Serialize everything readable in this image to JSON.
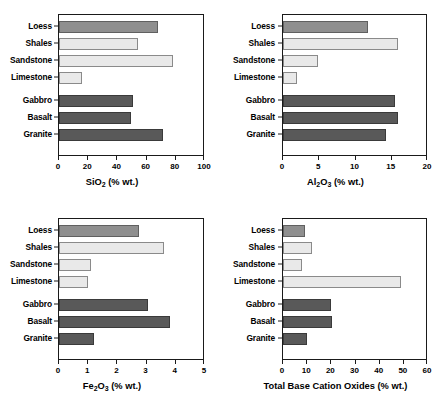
{
  "figure": {
    "categories": [
      "Loess",
      "Shales",
      "Sandstone",
      "Limestone",
      "Gabbro",
      "Basalt",
      "Granite"
    ],
    "group_colors": {
      "loess": "#8F8F8F",
      "sedimentary": "#E9E9E9",
      "igneous": "#595959"
    }
  },
  "chart_data": [
    {
      "type": "bar",
      "orientation": "horizontal",
      "panel": "top-left",
      "title": "",
      "xlabel": "SiO2 (% wt.)",
      "xlabel_parts": {
        "pre": "SiO",
        "sub": "2",
        "post": " (% wt.)"
      },
      "ylabel": "",
      "categories": [
        "Loess",
        "Shales",
        "Sandstone",
        "Limestone",
        "Gabbro",
        "Basalt",
        "Granite"
      ],
      "values": [
        68.0,
        54.0,
        78.0,
        16.0,
        50.5,
        49.5,
        71.0
      ],
      "xlim": [
        0,
        100
      ],
      "xticks": [
        0,
        20,
        40,
        60,
        80,
        100
      ],
      "xticklabels": [
        "0",
        "20",
        "40",
        "60",
        "80",
        "100"
      ],
      "grid": false,
      "legend": "none"
    },
    {
      "type": "bar",
      "orientation": "horizontal",
      "panel": "top-right",
      "title": "",
      "xlabel": "Al2O3 (% wt.)",
      "xlabel_parts": {
        "pre": "Al",
        "sub": "2",
        "mid": "O",
        "sub2": "3",
        "post": " (% wt.)"
      },
      "ylabel": "",
      "categories": [
        "Loess",
        "Shales",
        "Sandstone",
        "Limestone",
        "Gabbro",
        "Basalt",
        "Granite"
      ],
      "values": [
        11.7,
        15.8,
        4.8,
        1.9,
        15.5,
        15.8,
        14.2
      ],
      "xlim": [
        0,
        20
      ],
      "xticks": [
        0,
        5,
        10,
        15,
        20
      ],
      "xticklabels": [
        "0",
        "5",
        "10",
        "15",
        "20"
      ],
      "grid": false,
      "legend": "none"
    },
    {
      "type": "bar",
      "orientation": "horizontal",
      "panel": "bottom-left",
      "title": "",
      "xlabel": "Fe2O3 (% wt.)",
      "xlabel_parts": {
        "pre": "Fe",
        "sub": "2",
        "mid": "O",
        "sub2": "3",
        "post": " (% wt.)"
      },
      "ylabel": "",
      "categories": [
        "Loess",
        "Shales",
        "Sandstone",
        "Limestone",
        "Gabbro",
        "Basalt",
        "Granite"
      ],
      "values": [
        2.75,
        3.6,
        1.1,
        1.0,
        3.05,
        3.8,
        1.2
      ],
      "xlim": [
        0,
        5
      ],
      "xticks": [
        0,
        1,
        2,
        3,
        4,
        5
      ],
      "xticklabels": [
        "0",
        "1",
        "2",
        "3",
        "4",
        "5"
      ],
      "grid": false,
      "legend": "none"
    },
    {
      "type": "bar",
      "orientation": "horizontal",
      "panel": "bottom-right",
      "title": "",
      "xlabel": "Total Base Cation Oxides (% wt.)",
      "xlabel_parts": {
        "pre": "Total Base Cation Oxides (% wt.)",
        "sub": "",
        "post": ""
      },
      "ylabel": "",
      "categories": [
        "Loess",
        "Shales",
        "Sandstone",
        "Limestone",
        "Gabbro",
        "Basalt",
        "Granite"
      ],
      "values": [
        9.0,
        12.0,
        8.0,
        49.0,
        20.0,
        20.2,
        10.0
      ],
      "xlim": [
        0,
        60
      ],
      "xticks": [
        0,
        10,
        20,
        30,
        40,
        50,
        60
      ],
      "xticklabels": [
        "0",
        "10",
        "20",
        "30",
        "40",
        "50",
        "60"
      ],
      "grid": false,
      "legend": "none"
    }
  ]
}
